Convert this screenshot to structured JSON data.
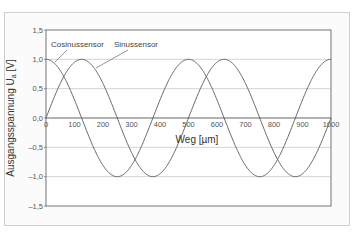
{
  "chart_data": {
    "type": "line",
    "title": "",
    "xlabel": "Weg [µm]",
    "ylabel": "Ausgangsspannung Ua [V]",
    "ylabel_main": "Ausgangsspannung U",
    "ylabel_sub": "a",
    "ylabel_unit": " [V]",
    "xlim": [
      0,
      1000
    ],
    "ylim": [
      -1.5,
      1.5
    ],
    "x_ticks": [
      0,
      100,
      200,
      300,
      400,
      500,
      600,
      700,
      800,
      900,
      1000
    ],
    "x_tick_labels": [
      "0",
      "100",
      "200",
      "300",
      "400",
      "500",
      "600",
      "700",
      "800",
      "900",
      "1000"
    ],
    "y_ticks": [
      1.5,
      1.0,
      0.5,
      0.0,
      -0.5,
      -1.0,
      -1.5
    ],
    "y_tick_labels": [
      "1,5",
      "1,0",
      "0,5",
      "0,0",
      "–0,5",
      "–1,0",
      "–1,5"
    ],
    "grid": "horizontal",
    "legend": "annotations",
    "period_um": 500,
    "series": [
      {
        "name": "Cosinussensor",
        "function": "cos(2*pi*x/500)",
        "x": [
          0,
          125,
          250,
          375,
          500,
          625,
          750,
          875,
          1000
        ],
        "values": [
          1.0,
          0.0,
          -1.0,
          0.0,
          1.0,
          0.0,
          -1.0,
          0.0,
          1.0
        ]
      },
      {
        "name": "Sinussensor",
        "function": "sin(2*pi*x/500)",
        "x": [
          0,
          125,
          250,
          375,
          500,
          625,
          750,
          875,
          1000
        ],
        "values": [
          0.0,
          1.0,
          0.0,
          -1.0,
          0.0,
          1.0,
          0.0,
          -1.0,
          0.0
        ]
      }
    ],
    "annotations": [
      {
        "text": "Cosinussensor",
        "points_to": "Cosinussensor"
      },
      {
        "text": "Sinussensor",
        "points_to": "Sinussensor"
      }
    ]
  },
  "colors": {
    "curve": "#555555",
    "grid": "#c8c8c8",
    "axis": "#444444",
    "frame": "#cfcfcf"
  }
}
